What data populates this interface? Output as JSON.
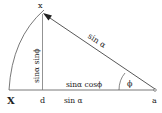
{
  "diagram": {
    "labels": {
      "top_point": "x",
      "left_point": "X",
      "foot_point": "d",
      "right_point": "a",
      "hypotenuse": "sin α",
      "vertical": "sinα sinϕ",
      "adjacent": "sinα cosϕ",
      "base": "sin α",
      "angle": "ϕ"
    },
    "colors": {
      "line": "#444444",
      "text": "#222222"
    }
  }
}
